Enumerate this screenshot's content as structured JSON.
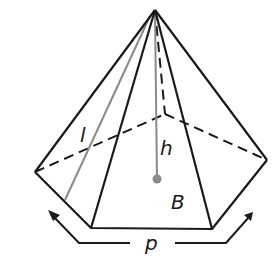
{
  "figure": {
    "type": "pentagonal pyramid",
    "labels": {
      "slant_height": "l",
      "height": "h",
      "base_area": "B",
      "perimeter": "p"
    },
    "colors": {
      "edge": "#1a1a1a",
      "highlight": "#8a8a8a",
      "background": "#ffffff"
    },
    "vertices": {
      "apex": [
        155,
        10
      ],
      "left": [
        35,
        172
      ],
      "back": [
        165,
        114
      ],
      "right": [
        267,
        160
      ],
      "front_right": [
        212,
        229
      ],
      "front_left": [
        91,
        228
      ]
    }
  }
}
